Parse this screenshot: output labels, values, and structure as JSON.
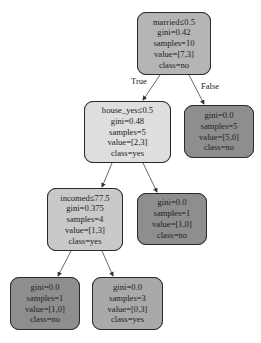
{
  "diagram": {
    "type": "decision-tree",
    "nodes": [
      {
        "id": "root",
        "split": "married≤0.5",
        "gini": "gini=0.42",
        "samples": "samples=10",
        "value": "value=[7,3]",
        "class": "class=no",
        "fill": "#b5b5b5"
      },
      {
        "id": "house",
        "split": "house_yes≤0.5",
        "gini": "gini=0.48",
        "samples": "samples=5",
        "value": "value=[2,3]",
        "class": "class=yes",
        "fill": "#dedede"
      },
      {
        "id": "leaf_false",
        "gini": "gini=0.0",
        "samples": "samples=5",
        "value": "value=[5,0]",
        "class": "class=no",
        "fill": "#8e8e8e"
      },
      {
        "id": "incomed",
        "split": "incomed≤77.5",
        "gini": "gini=0.375",
        "samples": "samples=4",
        "value": "value=[1,3]",
        "class": "class=yes",
        "fill": "#c9c9c9"
      },
      {
        "id": "leaf_house_right",
        "gini": "gini=0.0",
        "samples": "samples=1",
        "value": "value=[1,0]",
        "class": "class=no",
        "fill": "#8e8e8e"
      },
      {
        "id": "leaf_bottom_left",
        "gini": "gini=0.0",
        "samples": "samples=1",
        "value": "value=[1,0]",
        "class": "class=no",
        "fill": "#8e8e8e"
      },
      {
        "id": "leaf_bottom_right",
        "gini": "gini=0.0",
        "samples": "samples=3",
        "value": "value=[0,3]",
        "class": "class=yes",
        "fill": "#a9a9a9"
      }
    ],
    "edge_labels": {
      "true_label": "True",
      "false_label": "False"
    }
  }
}
